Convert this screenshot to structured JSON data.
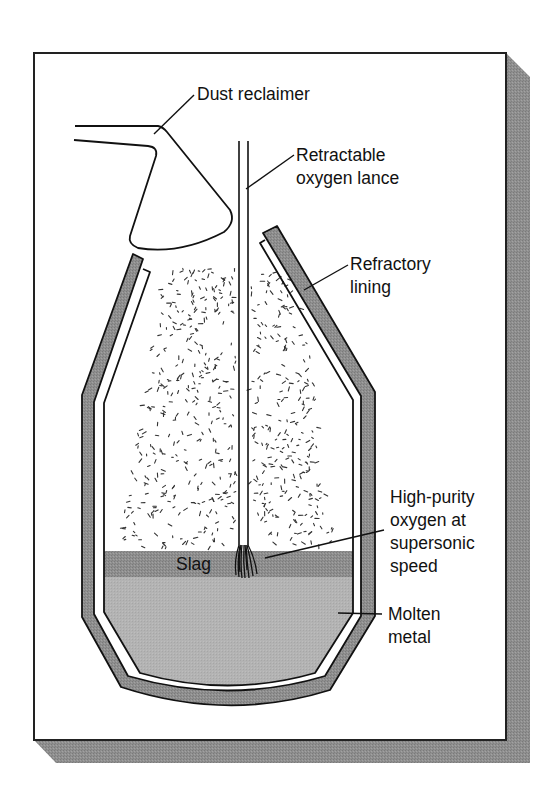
{
  "figure": {
    "colors": {
      "frame_stroke": "#222222",
      "shadow": "#8f8f8f",
      "refractory": "#8c8c8c",
      "slag": "#8a8a8a",
      "molten_metal": "#b3b3b3",
      "line": "#111111",
      "dust": "#333333"
    }
  },
  "labels": {
    "dust_reclaimer": "Dust reclaimer",
    "lance_line1": "Retractable",
    "lance_line2": "oxygen lance",
    "refractory_line1": "Refractory",
    "refractory_line2": "lining",
    "oxygen_line1": "High-purity",
    "oxygen_line2": "oxygen at",
    "oxygen_line3": "supersonic",
    "oxygen_line4": "speed",
    "molten_line1": "Molten",
    "molten_line2": "metal",
    "slag": "Slag"
  },
  "dust": {
    "seed": 7,
    "count": 620,
    "region": {
      "top": 268,
      "bottom": 548,
      "top_left": 165,
      "top_right": 300,
      "bottom_left": 118,
      "bottom_right": 336
    },
    "exclude_x": [
      236,
      251
    ]
  }
}
